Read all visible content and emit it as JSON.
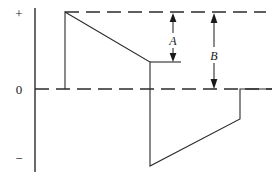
{
  "figure": {
    "background_color": "#ffffff",
    "line_color": "#2b2b2b",
    "width": 275,
    "height": 179
  },
  "axis": {
    "name": "vertical-amplitude-axis",
    "x": 35,
    "top_y": 8,
    "bottom_y": 172,
    "labels": {
      "positive": "+",
      "zero": "0",
      "negative": "−"
    },
    "label_positions": {
      "positive_y": 18,
      "zero_y": 93,
      "negative_y": 163
    }
  },
  "reference_lines": [
    {
      "name": "peak-reference-line",
      "style": "dashed",
      "y": 12,
      "x_start": 65,
      "x_end": 266
    },
    {
      "name": "zero-reference-line",
      "style": "dashed",
      "y": 89,
      "x_start": 35,
      "x_end": 272
    }
  ],
  "waveform": {
    "name": "sawtooth-trace",
    "style": "solid",
    "points": "65,89 65,12 150,62 150,166 240,119 240,89 272,89",
    "vertices": [
      {
        "label": "baseline-start",
        "x": 65,
        "y": 89
      },
      {
        "label": "positive-peak",
        "x": 65,
        "y": 12
      },
      {
        "label": "ramp-down-end",
        "x": 150,
        "y": 62
      },
      {
        "label": "negative-peak",
        "x": 150,
        "y": 166
      },
      {
        "label": "ramp-up-end",
        "x": 240,
        "y": 119
      },
      {
        "label": "return-to-zero",
        "x": 240,
        "y": 89
      },
      {
        "label": "baseline-end",
        "x": 272,
        "y": 89
      }
    ]
  },
  "level_markers": [
    {
      "name": "mid-level-tick",
      "y": 62,
      "x_start": 150,
      "x_end": 181
    }
  ],
  "dimensions": [
    {
      "name": "dimension-a",
      "label": "A",
      "x": 173,
      "y_top": 14,
      "y_bottom": 61,
      "label_x": 173,
      "label_y": 41,
      "description": "Ripple amplitude from peak down to mid level"
    },
    {
      "name": "dimension-b",
      "label": "B",
      "x": 214,
      "y_top": 14,
      "y_bottom": 88,
      "label_x": 214,
      "label_y": 56,
      "description": "Full amplitude from peak down to zero"
    }
  ]
}
